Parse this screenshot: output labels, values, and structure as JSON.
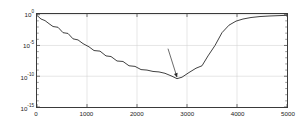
{
  "chart_data": {
    "type": "line",
    "title": "",
    "xlabel": "N",
    "ylabel": "e",
    "yscale": "log",
    "xscale": "linear",
    "xlim": [
      0,
      5000
    ],
    "ylim": [
      1e-15,
      1.3
    ],
    "grid": true,
    "legend": null,
    "xticks": [
      0,
      1000,
      2000,
      3000,
      4000,
      5000
    ],
    "xtick_labels": [
      "0",
      "1000",
      "2000",
      "3000",
      "4000",
      "5000"
    ],
    "yticks": [
      1,
      1e-05,
      1e-10,
      1e-15
    ],
    "ytick_labels": [
      "10^0",
      "10^-5",
      "10^-10",
      "10^-15"
    ],
    "ytick_mantissa": "10",
    "ytick_exponents": [
      "0",
      "-5",
      "-10",
      "-15"
    ],
    "series": [
      {
        "name": "error",
        "color": "#2b2b2b",
        "x": [
          20,
          80,
          160,
          240,
          320,
          420,
          520,
          620,
          720,
          820,
          920,
          1040,
          1140,
          1260,
          1380,
          1480,
          1600,
          1720,
          1840,
          1960,
          2080,
          2200,
          2320,
          2440,
          2560,
          2700,
          2800,
          2900,
          3040,
          3180,
          3300,
          3420,
          3560,
          3700,
          3840,
          3980,
          4120,
          4280,
          4460,
          4660,
          4860,
          5000
        ],
        "y": [
          0.55,
          0.2,
          0.11,
          0.035,
          0.012,
          0.009,
          0.0012,
          0.0009,
          0.00012,
          8e-05,
          2e-05,
          6e-06,
          1.5e-06,
          1.2e-06,
          2e-07,
          1.6e-07,
          3e-08,
          2.5e-08,
          5e-09,
          4e-09,
          1.2e-09,
          1e-09,
          6e-10,
          5e-10,
          3e-10,
          1e-10,
          4e-11,
          7e-11,
          4e-10,
          2e-09,
          5e-09,
          2e-07,
          1e-05,
          0.0012,
          0.02,
          0.09,
          0.2,
          0.35,
          0.5,
          0.62,
          0.72,
          0.8
        ]
      }
    ],
    "annotations": [
      {
        "name": "n-opt-annotation",
        "text": "N",
        "subscript": "opt",
        "target_x": 2800,
        "target_y": 4e-11,
        "label_x": 2620,
        "label_y": 3e-06,
        "arrow": true
      }
    ],
    "axis_labels": {
      "y_axis_inline": "e",
      "x_axis_inline": "N"
    }
  },
  "figure": {
    "background": "#ffffff",
    "axes_color": "#3a3a3a",
    "grid_color": "#cccccc",
    "line_color": "#2b2b2b"
  }
}
